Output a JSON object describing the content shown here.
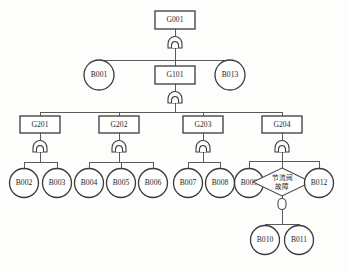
{
  "diagram": {
    "kind": "fault-tree",
    "canvas": {
      "width": 349,
      "height": 271,
      "background": "#fdfdfc"
    },
    "colors": {
      "stroke": "#3a3a3a",
      "edge": "#5b5b5b",
      "fill": "#ffffff",
      "text": "#1d1d1d"
    },
    "nodes": {
      "g001": {
        "label": "G001",
        "shape": "rect",
        "x": 175,
        "y": 20
      },
      "b001": {
        "label": "B001",
        "shape": "circle",
        "x": 99,
        "y": 75
      },
      "g101": {
        "label": "G101",
        "shape": "rect",
        "x": 175,
        "y": 75
      },
      "b013": {
        "label": "B013",
        "shape": "circle",
        "x": 230,
        "y": 75
      },
      "g201": {
        "label": "G201",
        "shape": "rect",
        "x": 40,
        "y": 125
      },
      "g202": {
        "label": "G202",
        "shape": "rect",
        "x": 119,
        "y": 125
      },
      "g203": {
        "label": "G203",
        "shape": "rect",
        "x": 203,
        "y": 125
      },
      "g204": {
        "label": "G204",
        "shape": "rect",
        "x": 282,
        "y": 125
      },
      "b002": {
        "label": "B002",
        "shape": "circle",
        "x": 24,
        "y": 183
      },
      "b003": {
        "label": "B003",
        "shape": "circle",
        "x": 57,
        "y": 183
      },
      "b004": {
        "label": "B004",
        "shape": "circle",
        "x": 89,
        "y": 183
      },
      "b005": {
        "label": "B005",
        "shape": "circle",
        "x": 121,
        "y": 183
      },
      "b006": {
        "label": "B006",
        "shape": "circle",
        "x": 153,
        "y": 183
      },
      "b007": {
        "label": "B007",
        "shape": "circle",
        "x": 188,
        "y": 183
      },
      "b008": {
        "label": "B008",
        "shape": "circle",
        "x": 220,
        "y": 183
      },
      "b009": {
        "label": "B009",
        "shape": "circle",
        "x": 249,
        "y": 183
      },
      "throttle": {
        "label_line1": "节流阀",
        "label_line2": "故障",
        "shape": "diamond",
        "x": 282,
        "y": 182
      },
      "b012": {
        "label": "B012",
        "shape": "circle",
        "x": 319,
        "y": 183
      },
      "b010": {
        "label": "B010",
        "shape": "circle",
        "x": 265,
        "y": 240
      },
      "b011": {
        "label": "B011",
        "shape": "circle",
        "x": 299,
        "y": 240
      }
    },
    "gates": [
      {
        "id": "gate-g001",
        "type": "and",
        "x": 175,
        "y": 42,
        "parent": "g001"
      },
      {
        "id": "gate-g101",
        "type": "and",
        "x": 175,
        "y": 97,
        "parent": "g101"
      },
      {
        "id": "gate-g201",
        "type": "and",
        "x": 40,
        "y": 146,
        "parent": "g201"
      },
      {
        "id": "gate-g202",
        "type": "and",
        "x": 119,
        "y": 146,
        "parent": "g202"
      },
      {
        "id": "gate-g203",
        "type": "and",
        "x": 203,
        "y": 146,
        "parent": "g203"
      },
      {
        "id": "gate-g204",
        "type": "and",
        "x": 282,
        "y": 146,
        "parent": "g204"
      },
      {
        "id": "gate-throttle",
        "type": "or-capsule",
        "x": 282,
        "y": 203,
        "parent": "throttle"
      }
    ],
    "connections": [
      {
        "from": "g001",
        "to": [
          "b001",
          "g101",
          "b013"
        ],
        "via_gate": "gate-g001"
      },
      {
        "from": "g101",
        "to": [
          "g201",
          "g202",
          "g203",
          "g204"
        ],
        "via_gate": "gate-g101"
      },
      {
        "from": "g201",
        "to": [
          "b002",
          "b003"
        ],
        "via_gate": "gate-g201"
      },
      {
        "from": "g202",
        "to": [
          "b004",
          "b005",
          "b006"
        ],
        "via_gate": "gate-g202"
      },
      {
        "from": "g203",
        "to": [
          "b007",
          "b008"
        ],
        "via_gate": "gate-g203"
      },
      {
        "from": "g204",
        "to": [
          "b009",
          "throttle",
          "b012"
        ],
        "via_gate": "gate-g204"
      },
      {
        "from": "throttle",
        "to": [
          "b010",
          "b011"
        ],
        "via_gate": "gate-throttle"
      }
    ]
  }
}
